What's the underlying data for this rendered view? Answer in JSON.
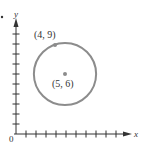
{
  "chart_data": {
    "type": "scatter",
    "title": "",
    "xlabel": "x",
    "ylabel": "y",
    "origin_label": "0",
    "xlim": [
      0,
      11
    ],
    "ylim": [
      0,
      11
    ],
    "x_ticks": [
      1,
      2,
      3,
      4,
      5,
      6,
      7,
      8,
      9,
      10
    ],
    "y_ticks": [
      1,
      2,
      3,
      4,
      5,
      6,
      7,
      8,
      9,
      10
    ],
    "grid": false,
    "shapes": [
      {
        "type": "circle",
        "center": [
          5,
          6
        ],
        "radius": 3.1623,
        "equation": "(x-5)^2 + (y-6)^2 = 10"
      }
    ],
    "points": [
      {
        "x": 4,
        "y": 9,
        "label": "(4, 9)"
      },
      {
        "x": 5,
        "y": 6,
        "label": "(5, 6)"
      }
    ],
    "colors": {
      "axis": "#333333",
      "circle": "#8c8c8c",
      "point": "#8c8c8c"
    }
  }
}
